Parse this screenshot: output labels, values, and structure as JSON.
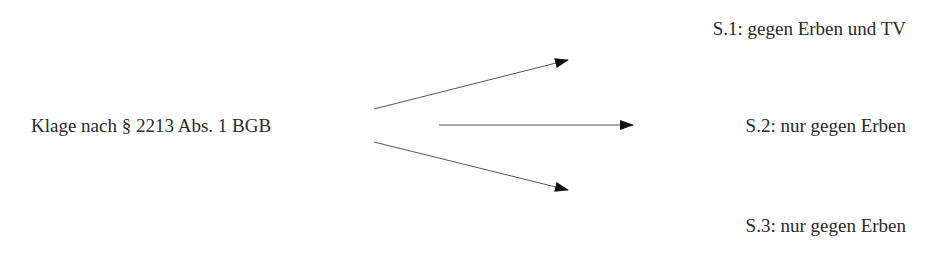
{
  "diagram": {
    "source": {
      "label": "Klage nach § 2213 Abs. 1 BGB"
    },
    "targets": [
      {
        "label": "S.1: gegen Erben und TV"
      },
      {
        "label": "S.2: nur gegen Erben"
      },
      {
        "label": "S.3: nur gegen Erben"
      }
    ],
    "edges": [
      {
        "from": "source",
        "to": "targets.0",
        "x1": 374,
        "y1": 109,
        "x2": 568,
        "y2": 60
      },
      {
        "from": "source",
        "to": "targets.1",
        "x1": 439,
        "y1": 125,
        "x2": 633,
        "y2": 125
      },
      {
        "from": "source",
        "to": "targets.2",
        "x1": 374,
        "y1": 142,
        "x2": 568,
        "y2": 190
      }
    ],
    "colors": {
      "text": "#2a2a2a",
      "line": "#555555",
      "arrowhead": "#111111"
    }
  }
}
